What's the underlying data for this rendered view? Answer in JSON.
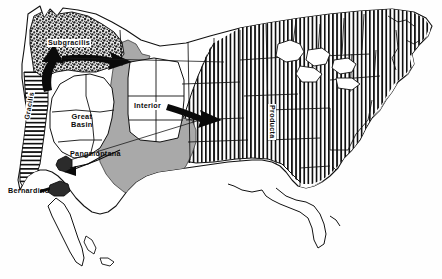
{
  "figure": {
    "kind": "biogeographic-distribution-map",
    "region": "contiguous-united-states"
  },
  "labels": {
    "subgracilis": "Subgracilis",
    "gracilis": "Gracilis",
    "great_basin": "Great\nBasin",
    "great_basin_line1": "Great",
    "great_basin_line2": "Basin",
    "pangmontana": "Pangmontana",
    "interior": "Interior",
    "producta": "Producta",
    "bernardino": "Bernardino"
  },
  "regions": [
    {
      "id": "subgracilis",
      "label": "Subgracilis",
      "fill": "stipple",
      "fill_color": "#3a3a3a",
      "location": "pacific-northwest"
    },
    {
      "id": "gracilis",
      "label": "Gracilis",
      "fill": "horizontal-hatch",
      "fill_color": "#111111",
      "location": "pacific-coast-california"
    },
    {
      "id": "great-basin",
      "label": "Great Basin",
      "fill": "none",
      "fill_color": "#ffffff",
      "location": "great-basin"
    },
    {
      "id": "pangmontana",
      "label": "Pangmontana",
      "fill": "solid-gray",
      "fill_color": "#a9a9a9",
      "location": "intermountain-west"
    },
    {
      "id": "interior",
      "label": "Interior",
      "fill": "none",
      "fill_color": "#ffffff",
      "location": "rocky-mountain-interior"
    },
    {
      "id": "producta",
      "label": "Producta",
      "fill": "vertical-hatch",
      "fill_color": "#101010",
      "location": "eastern-and-central-united-states"
    },
    {
      "id": "bernardino",
      "label": "Bernardino",
      "fill": "solid-dark",
      "fill_color": "#2a2a2a",
      "location": "southern-california-mountains"
    }
  ],
  "arrows": [
    {
      "id": "arrow-northwest-to-interior",
      "from": "subgracilis",
      "to": "interior",
      "direction": "southeast"
    },
    {
      "id": "arrow-interior-to-producta",
      "from": "interior",
      "to": "producta",
      "direction": "east"
    },
    {
      "id": "arrow-gracilis-north",
      "from": "gracilis",
      "to": "subgracilis",
      "direction": "north"
    },
    {
      "id": "arrow-bernardino-leader",
      "from": "bernardino-label",
      "to": "bernardino",
      "direction": "east"
    },
    {
      "id": "arrow-pangmontana-leader",
      "from": "pangmontana-label",
      "to": "pangmontana",
      "direction": "southwest"
    }
  ],
  "colors": {
    "outline": "#111111",
    "gray_fill": "#a9a9a9",
    "stipple": "#3a3a3a",
    "background": "#ffffff"
  }
}
